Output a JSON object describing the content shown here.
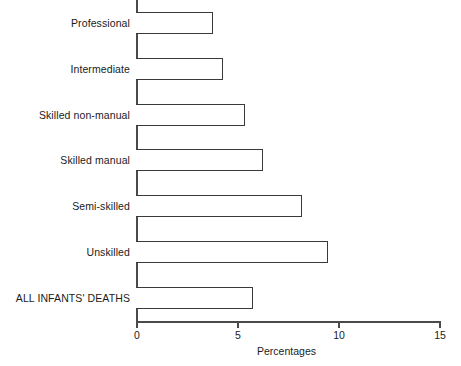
{
  "chart_data": {
    "type": "bar",
    "orientation": "horizontal",
    "title": "",
    "xlabel": "Percentages",
    "ylabel": "",
    "xlim": [
      0,
      15
    ],
    "xticks": [
      0,
      5,
      10,
      15
    ],
    "xtick_labels": [
      "0",
      "5",
      "10",
      "15"
    ],
    "grid": false,
    "legend": false,
    "categories": [
      "Professional",
      "Intermediate",
      "Skilled non-manual",
      "Skilled manual",
      "Semi-skilled",
      "Unskilled",
      "ALL INFANTS' DEATHS"
    ],
    "values": [
      3.8,
      4.3,
      5.4,
      6.3,
      8.2,
      9.5,
      5.8
    ],
    "bar_style": {
      "fill": "#ffffff",
      "edge": "#3a3a3a",
      "edge_width": 1.6
    }
  },
  "axis": {
    "line_color": "#4a4a4a"
  }
}
